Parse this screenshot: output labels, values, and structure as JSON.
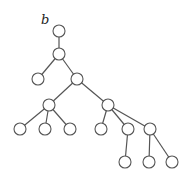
{
  "diagram": {
    "type": "rooted-tree",
    "root_label": "b",
    "node_radius": 6,
    "colors": {
      "stroke": "#555555",
      "fill": "#ffffff",
      "label": "#222222"
    },
    "label_pos": {
      "x": 41,
      "y": 24
    },
    "nodes": [
      {
        "id": "n0",
        "x": 59,
        "y": 31
      },
      {
        "id": "n1",
        "x": 59,
        "y": 54
      },
      {
        "id": "n2",
        "x": 38,
        "y": 79
      },
      {
        "id": "n3",
        "x": 77,
        "y": 79
      },
      {
        "id": "n4",
        "x": 49,
        "y": 105
      },
      {
        "id": "n5",
        "x": 108,
        "y": 105
      },
      {
        "id": "n6",
        "x": 20,
        "y": 129
      },
      {
        "id": "n7",
        "x": 45,
        "y": 129
      },
      {
        "id": "n8",
        "x": 70,
        "y": 129
      },
      {
        "id": "n9",
        "x": 101,
        "y": 129
      },
      {
        "id": "n10",
        "x": 128,
        "y": 129
      },
      {
        "id": "n11",
        "x": 150,
        "y": 129
      },
      {
        "id": "n12",
        "x": 125,
        "y": 162
      },
      {
        "id": "n13",
        "x": 149,
        "y": 162
      },
      {
        "id": "n14",
        "x": 172,
        "y": 162
      }
    ],
    "edges": [
      [
        "n0",
        "n1"
      ],
      [
        "n1",
        "n2"
      ],
      [
        "n1",
        "n3"
      ],
      [
        "n3",
        "n4"
      ],
      [
        "n3",
        "n5"
      ],
      [
        "n4",
        "n6"
      ],
      [
        "n4",
        "n7"
      ],
      [
        "n4",
        "n8"
      ],
      [
        "n5",
        "n9"
      ],
      [
        "n5",
        "n10"
      ],
      [
        "n5",
        "n11"
      ],
      [
        "n10",
        "n12"
      ],
      [
        "n11",
        "n13"
      ],
      [
        "n11",
        "n14"
      ]
    ]
  }
}
